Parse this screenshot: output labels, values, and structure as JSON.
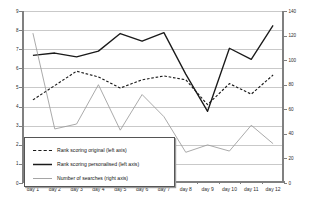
{
  "chart_data": {
    "type": "line",
    "title": "",
    "subtitle": "",
    "xlabel": "",
    "ylabel": "",
    "grid": true,
    "legend_position": "inside-bottom-left",
    "categories": [
      "day 1",
      "day 2",
      "day 3",
      "day 4",
      "day 5",
      "day 6",
      "day 7",
      "day 8",
      "day 9",
      "day 10",
      "day 11",
      "day 12"
    ],
    "axes": {
      "left": {
        "label": "left axis",
        "min": 0,
        "max": 9,
        "step": 1,
        "ticks": [
          "0",
          "1",
          "2",
          "3",
          "4",
          "5",
          "6",
          "7",
          "8",
          "9"
        ]
      },
      "right": {
        "label": "right axis",
        "min": 0,
        "max": 140,
        "step": 20,
        "ticks": [
          "0",
          "20",
          "40",
          "60",
          "80",
          "100",
          "120",
          "140"
        ]
      }
    },
    "series": [
      {
        "name": "Rank scoring original (left axis)",
        "legend_label": "Rank scoring original (left axis)",
        "axis": "left",
        "style": "dashed",
        "color": "#1a1a1a",
        "values": [
          4.35,
          5.1,
          5.85,
          5.55,
          4.97,
          5.4,
          5.6,
          5.4,
          4.1,
          5.2,
          4.65,
          5.65
        ]
      },
      {
        "name": "Rank scoring personalised (left axis)",
        "legend_label": "Rank scoring personalised (left axis)",
        "axis": "left",
        "style": "solid",
        "color": "#1a1a1a",
        "values": [
          6.68,
          6.8,
          6.6,
          6.9,
          7.82,
          7.42,
          7.87,
          5.7,
          3.75,
          7.05,
          6.47,
          8.25
        ]
      },
      {
        "name": "Number of searches (right axis)",
        "legend_label": "Number of searches (right axis)",
        "axis": "right",
        "style": "solid-thin",
        "color": "#9b9b9b",
        "values": [
          122,
          44,
          48,
          80,
          43,
          72,
          54,
          25,
          31,
          26,
          47,
          32
        ]
      }
    ]
  }
}
